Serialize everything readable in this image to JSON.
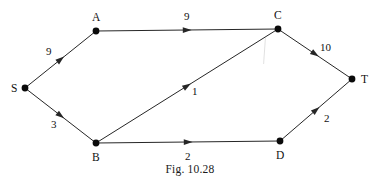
{
  "figure": {
    "caption": "Fig. 10.28"
  },
  "diagram": {
    "type": "directed-weighted-graph",
    "stroke_color": "#262626",
    "node_color": "#0a0a0a",
    "nodes": [
      {
        "id": "S",
        "label": "S",
        "x": 25,
        "y": 88,
        "label_x": 11,
        "label_y": 83
      },
      {
        "id": "A",
        "label": "A",
        "x": 96,
        "y": 31,
        "label_x": 92,
        "label_y": 12
      },
      {
        "id": "C",
        "label": "C",
        "x": 278,
        "y": 29,
        "label_x": 274,
        "label_y": 10
      },
      {
        "id": "T",
        "label": "T",
        "x": 352,
        "y": 79,
        "label_x": 361,
        "label_y": 74
      },
      {
        "id": "B",
        "label": "B",
        "x": 96,
        "y": 143,
        "label_x": 92,
        "label_y": 152
      },
      {
        "id": "D",
        "label": "D",
        "x": 280,
        "y": 141,
        "label_x": 276,
        "label_y": 150
      }
    ],
    "edges": [
      {
        "from": "S",
        "to": "A",
        "weight": "9",
        "label_x": 46,
        "label_y": 46
      },
      {
        "from": "A",
        "to": "C",
        "weight": "9",
        "label_x": 184,
        "label_y": 11
      },
      {
        "from": "S",
        "to": "B",
        "weight": "3",
        "label_x": 51,
        "label_y": 119
      },
      {
        "from": "B",
        "to": "D",
        "weight": "2",
        "label_x": 185,
        "label_y": 151
      },
      {
        "from": "B",
        "to": "C",
        "weight": "1",
        "label_x": 192,
        "label_y": 86
      },
      {
        "from": "C",
        "to": "T",
        "weight": "10",
        "label_x": 320,
        "label_y": 42
      },
      {
        "from": "D",
        "to": "T",
        "weight": "2",
        "label_x": 324,
        "label_y": 113
      }
    ]
  }
}
